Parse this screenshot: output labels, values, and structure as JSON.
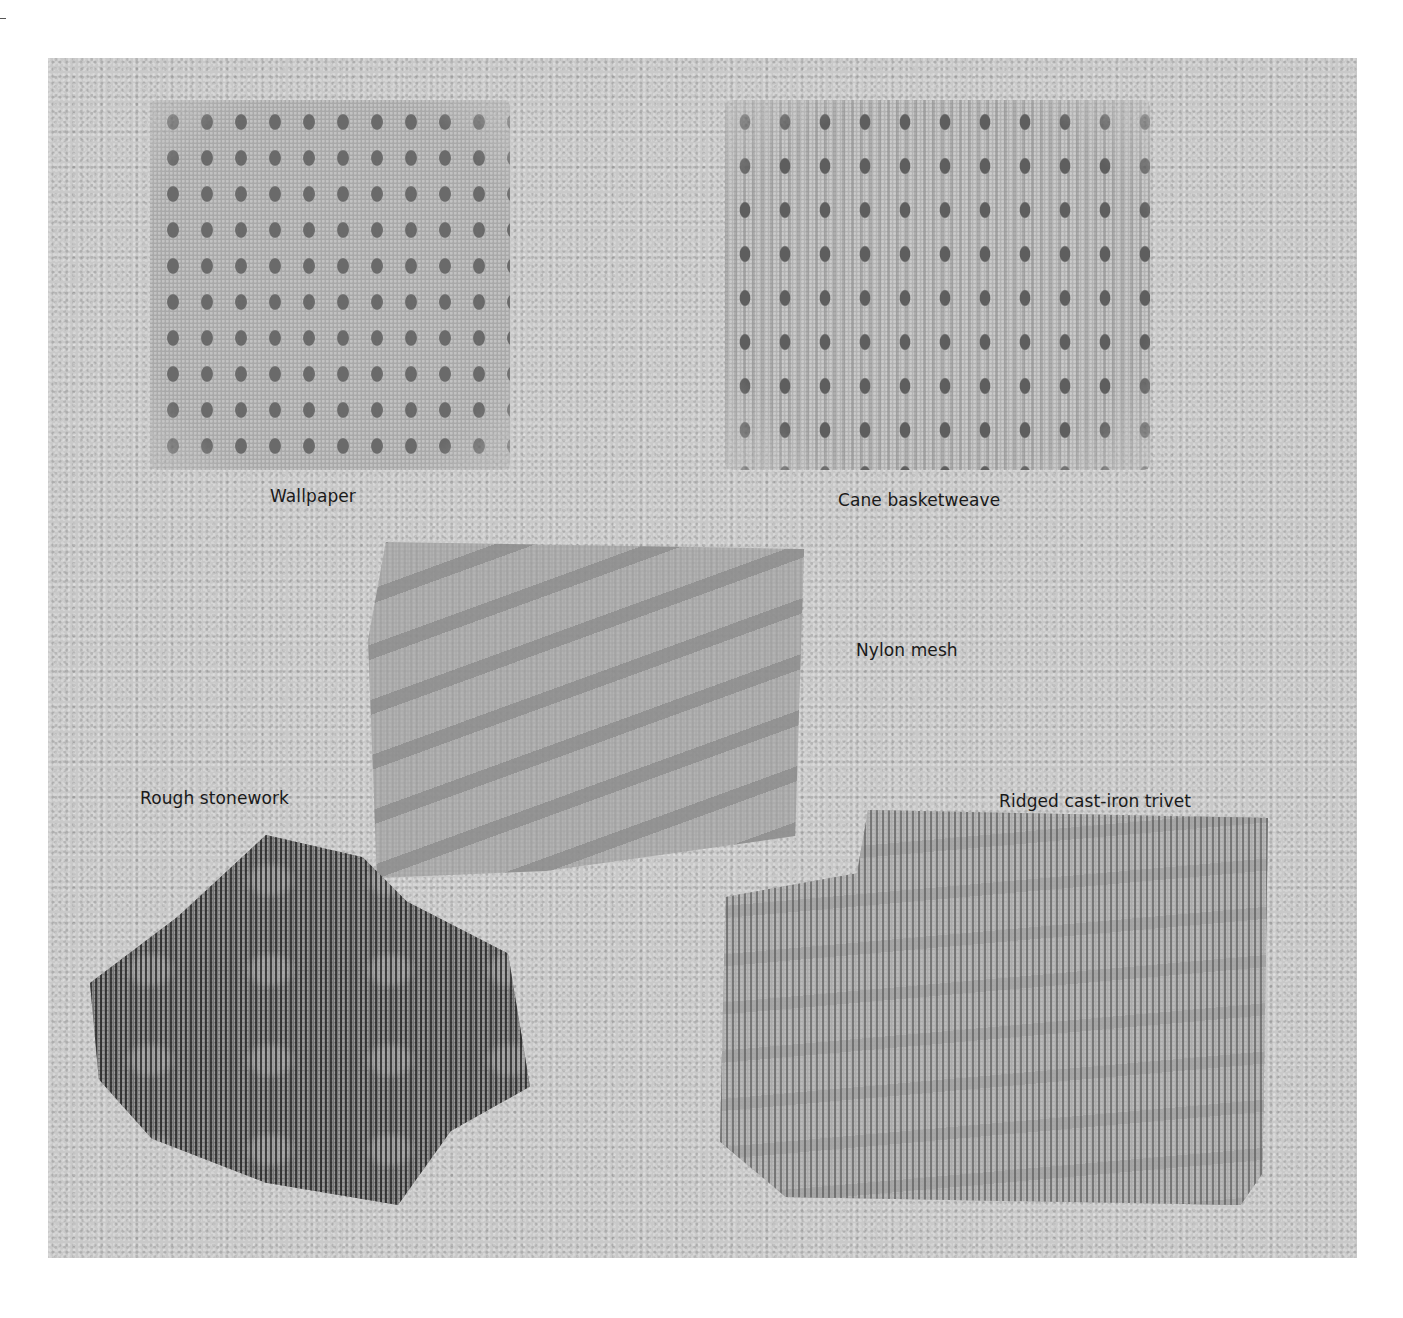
{
  "figure": {
    "background": {
      "paper_color": "#c9c9c9",
      "page_color": "#ffffff"
    },
    "rubbings": [
      {
        "id": "wallpaper",
        "label": "Wallpaper",
        "tone": "#6a6a6a"
      },
      {
        "id": "cane",
        "label": "Cane basketweave",
        "tone": "#5e5e5e"
      },
      {
        "id": "nylon",
        "label": "Nylon mesh",
        "tone": "#a3a3a3"
      },
      {
        "id": "stone",
        "label": "Rough stonework",
        "tone": "#5a5a5a"
      },
      {
        "id": "trivet",
        "label": "Ridged cast-iron trivet",
        "tone": "#9c9c9c"
      }
    ]
  }
}
